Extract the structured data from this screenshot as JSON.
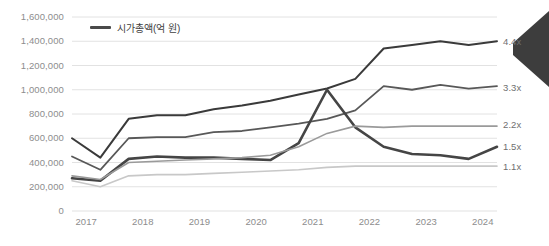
{
  "legend": {
    "label": "시가총액(억 원)",
    "swatch_color": "#4a4a4a"
  },
  "axes": {
    "y_ticks": [
      "1,600,000",
      "1,400,000",
      "1,200,000",
      "1,000,000",
      "800,000",
      "600,000",
      "400,000",
      "200,000",
      "0"
    ],
    "x_ticks": [
      "2017",
      "2018",
      "2019",
      "2020",
      "2021",
      "2022",
      "2023",
      "2024"
    ]
  },
  "right_labels": [
    {
      "text": "4.4x",
      "y": 42
    },
    {
      "text": "3.3x",
      "y": 88
    },
    {
      "text": "2.2x",
      "y": 125
    },
    {
      "text": "1.5x",
      "y": 147
    },
    {
      "text": "1.1x",
      "y": 167
    }
  ],
  "colors": {
    "series_1": "#3a3a3a",
    "series_2": "#585858",
    "series_3": "#454545",
    "series_4": "#9a9a9a",
    "series_5": "#c8c8c8",
    "gridline": "#e2e2e2",
    "axis_text": "#8d8d8d",
    "arrow": "#3d3d3d"
  },
  "chart_data": {
    "type": "line",
    "title": "",
    "subtitle": "",
    "xlabel": "",
    "ylabel": "시가총액(억 원)",
    "ylim": [
      0,
      1600000
    ],
    "ytick_values": [
      0,
      200000,
      400000,
      600000,
      800000,
      1000000,
      1200000,
      1400000,
      1600000
    ],
    "grid": true,
    "legend_position": "top-left",
    "x": [
      "2017",
      "2017.5",
      "2018",
      "2018.5",
      "2019",
      "2019.5",
      "2020",
      "2020.5",
      "2021",
      "2021.5",
      "2022",
      "2022.5",
      "2023",
      "2023.5",
      "2024",
      "2024.5"
    ],
    "annotations": [
      {
        "text": "4.4x",
        "series": "series_1",
        "position": "right-end"
      },
      {
        "text": "3.3x",
        "series": "series_2",
        "position": "right-end"
      },
      {
        "text": "2.2x",
        "series": "series_4",
        "position": "right-end"
      },
      {
        "text": "1.5x",
        "series": "series_3",
        "position": "right-end"
      },
      {
        "text": "1.1x",
        "series": "series_5",
        "position": "right-end"
      }
    ],
    "series": [
      {
        "name": "series_1",
        "multiplier": "4.4x",
        "color": "#3a3a3a",
        "width": 2.0,
        "values": [
          600000,
          440000,
          760000,
          790000,
          790000,
          840000,
          870000,
          910000,
          960000,
          1010000,
          1090000,
          1340000,
          1370000,
          1400000,
          1370000,
          1400000
        ]
      },
      {
        "name": "series_2",
        "multiplier": "3.3x",
        "color": "#585858",
        "width": 1.8,
        "values": [
          450000,
          340000,
          600000,
          610000,
          610000,
          650000,
          660000,
          690000,
          720000,
          760000,
          830000,
          1030000,
          1000000,
          1040000,
          1010000,
          1030000
        ]
      },
      {
        "name": "series_3",
        "multiplier": "1.5x",
        "color": "#454545",
        "width": 2.6,
        "values": [
          270000,
          250000,
          430000,
          450000,
          440000,
          440000,
          430000,
          420000,
          560000,
          1000000,
          690000,
          530000,
          470000,
          460000,
          430000,
          530000
        ]
      },
      {
        "name": "series_4",
        "multiplier": "2.2x",
        "color": "#9a9a9a",
        "width": 1.6,
        "values": [
          290000,
          260000,
          400000,
          410000,
          420000,
          430000,
          440000,
          460000,
          530000,
          640000,
          700000,
          690000,
          700000,
          700000,
          700000,
          700000
        ]
      },
      {
        "name": "series_5",
        "multiplier": "1.1x",
        "color": "#c8c8c8",
        "width": 1.6,
        "values": [
          250000,
          200000,
          290000,
          300000,
          300000,
          310000,
          320000,
          330000,
          340000,
          360000,
          370000,
          370000,
          370000,
          370000,
          370000,
          370000
        ]
      }
    ]
  }
}
